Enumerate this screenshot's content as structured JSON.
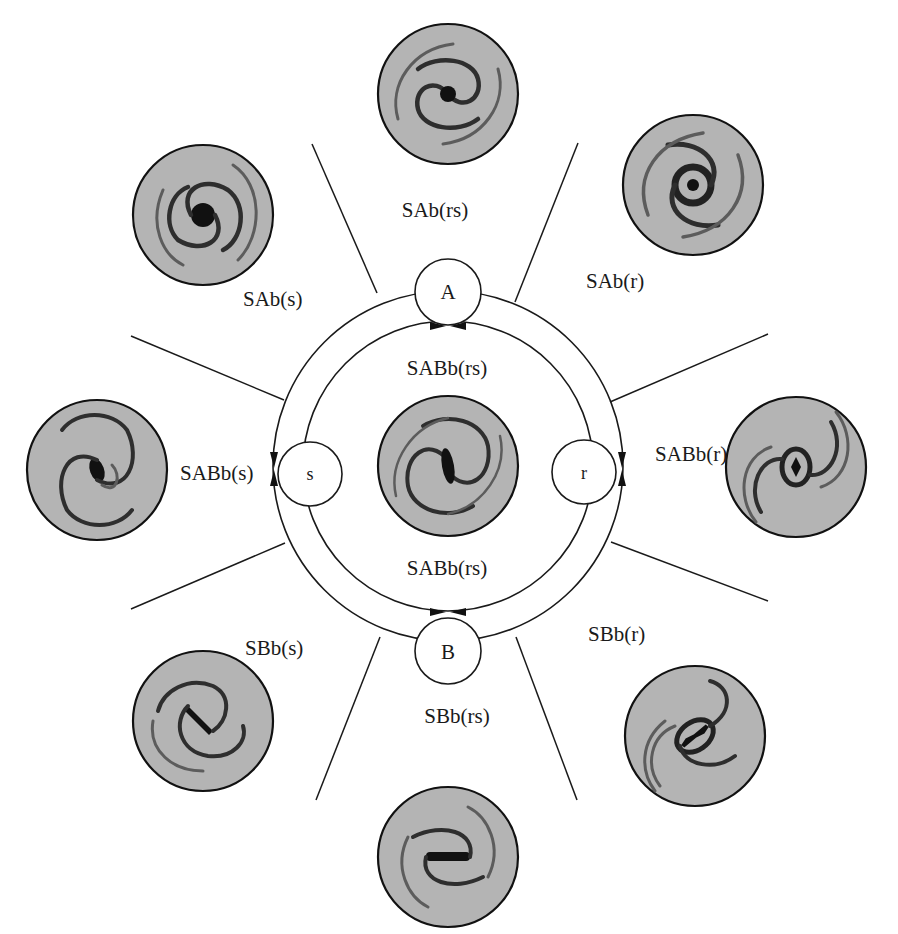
{
  "diagram": {
    "type": "galaxy-morphology-classification-wheel",
    "center_nodes": {
      "top": "A",
      "bottom": "B",
      "left": "s",
      "right": "r"
    },
    "inner_labels": {
      "upper": "SABb(rs)",
      "lower": "SABb(rs)"
    },
    "galaxies": [
      {
        "id": "top",
        "label": "SAb(rs)",
        "center_x": 448,
        "center_y": 94
      },
      {
        "id": "top-right",
        "label": "SAb(r)",
        "center_x": 693,
        "center_y": 185
      },
      {
        "id": "right",
        "label": "SABb(r)",
        "center_x": 796,
        "center_y": 467
      },
      {
        "id": "bottom-right",
        "label": "SBb(r)",
        "center_x": 695,
        "center_y": 736
      },
      {
        "id": "bottom",
        "label": "SBb(rs)",
        "center_x": 448,
        "center_y": 857
      },
      {
        "id": "bottom-left",
        "label": "SBb(s)",
        "center_x": 203,
        "center_y": 721
      },
      {
        "id": "left",
        "label": "SABb(s)",
        "center_x": 97,
        "center_y": 470
      },
      {
        "id": "top-left",
        "label": "SAb(s)",
        "center_x": 203,
        "center_y": 215
      },
      {
        "id": "center",
        "label": "",
        "center_x": 448,
        "center_y": 466
      }
    ],
    "colors": {
      "line": "#1a1a1a",
      "galaxy_disc": "#b4b4b4",
      "galaxy_arms": "#2e2e2e",
      "background": "#ffffff"
    }
  }
}
